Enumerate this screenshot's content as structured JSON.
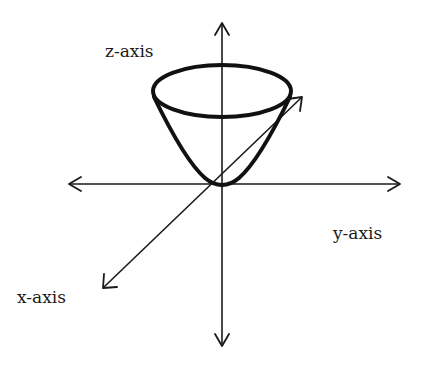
{
  "diagram": {
    "title": "",
    "type": "3D coordinate axes with elliptic paraboloid",
    "labels": {
      "z_axis": "z-axis",
      "y_axis": "y-axis",
      "x_axis": "x-axis"
    },
    "colors": {
      "stroke": "#1a1a1a",
      "surface": "#111111",
      "background": "#ffffff"
    },
    "elements": [
      {
        "id": "z-axis",
        "kind": "double-arrow line",
        "direction": "vertical"
      },
      {
        "id": "y-axis",
        "kind": "double-arrow line",
        "direction": "horizontal"
      },
      {
        "id": "x-axis",
        "kind": "double-arrow line",
        "direction": "diagonal (lower-left to upper-right)"
      },
      {
        "id": "paraboloid",
        "kind": "surface",
        "description": "upward-opening bowl with vertex at origin and elliptical rim"
      }
    ]
  }
}
